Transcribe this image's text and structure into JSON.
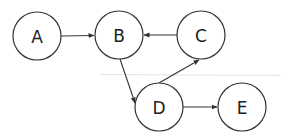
{
  "diagram": {
    "type": "directed-graph",
    "nodes": [
      {
        "id": "A",
        "label": "A",
        "x": 37,
        "y": 36
      },
      {
        "id": "B",
        "label": "B",
        "x": 119,
        "y": 35
      },
      {
        "id": "C",
        "label": "C",
        "x": 201,
        "y": 35
      },
      {
        "id": "D",
        "label": "D",
        "x": 159,
        "y": 107
      },
      {
        "id": "E",
        "label": "E",
        "x": 242,
        "y": 107
      }
    ],
    "edges": [
      {
        "from": "A",
        "to": "B"
      },
      {
        "from": "C",
        "to": "B"
      },
      {
        "from": "B",
        "to": "D"
      },
      {
        "from": "D",
        "to": "C"
      },
      {
        "from": "D",
        "to": "E"
      }
    ],
    "node_radius": 24,
    "colors": {
      "stroke": "#333333",
      "divider": "#e4e4e4",
      "background": "#ffffff"
    }
  }
}
